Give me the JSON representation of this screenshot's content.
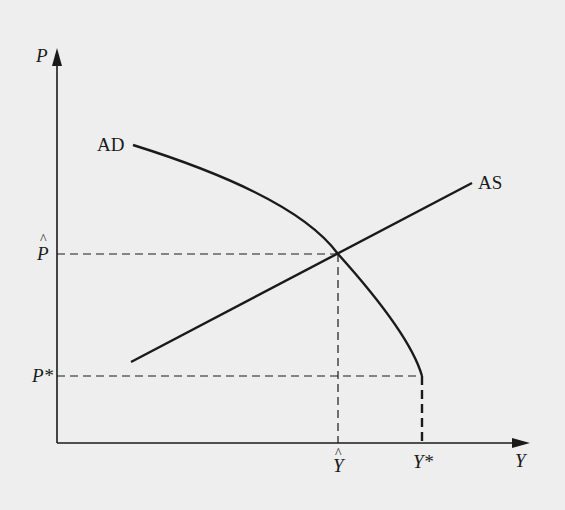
{
  "diagram": {
    "axes": {
      "y_label": "P",
      "x_label": "Y"
    },
    "curves": {
      "ad_label": "AD",
      "as_label": "AS"
    },
    "ticks": {
      "p_hat": "P",
      "p_hat_accent": "^",
      "p_star": "P*",
      "y_hat": "Y",
      "y_hat_accent": "^",
      "y_star": "Y*"
    },
    "colors": {
      "background": "#eeeeee",
      "ink": "#1a1a1a"
    }
  }
}
